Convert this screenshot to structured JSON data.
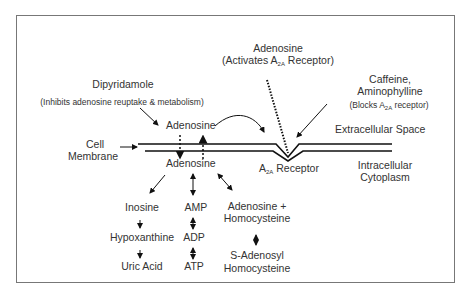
{
  "diagram": {
    "labels": {
      "adenosine_top": "Adenosine",
      "adenosine_top_note_pre": "(Activates A",
      "adenosine_top_note_sub": "2A",
      "adenosine_top_note_post": " Receptor)",
      "dipyridamole": "Dipyridamole",
      "dipyridamole_note": "(Inhibits adenosine reuptake & metabolism)",
      "caffeine": "Caffeine,",
      "aminophylline": "Aminophylline",
      "caffeine_note_pre": "(Blocks A",
      "caffeine_note_sub": "2A",
      "caffeine_note_post": " receptor)",
      "extracellular": "Extracellular Space",
      "adenosine_extra": "Adenosine",
      "cell_membrane_1": "Cell",
      "cell_membrane_2": "Membrane",
      "adenosine_intra": "Adenosine",
      "receptor_pre": "A",
      "receptor_sub": "2A",
      "receptor_post": " Receptor",
      "intracellular_1": "Intracellular",
      "intracellular_2": "Cytoplasm",
      "inosine": "Inosine",
      "hypoxanthine": "Hypoxanthine",
      "uric_acid": "Uric Acid",
      "amp": "AMP",
      "adp": "ADP",
      "atp": "ATP",
      "adenosine_homocysteine_1": "Adenosine +",
      "adenosine_homocysteine_2": "Homocysteine",
      "sah_1": "S-Adenosyl",
      "sah_2": "Homocysteine"
    },
    "colors": {
      "line": "#111111",
      "text": "#333333",
      "border": "#777777"
    }
  }
}
